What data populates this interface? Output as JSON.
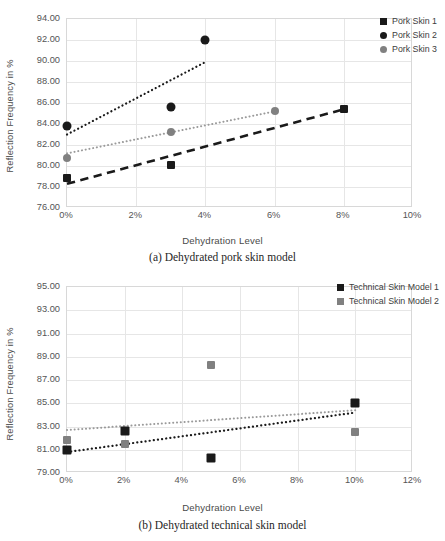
{
  "colors": {
    "series_black": "#1a1a1a",
    "series_gray": "#808080",
    "grid": "#e6e6e6",
    "axis_border": "#d8d8d8",
    "text": "#555555",
    "caption": "#262626"
  },
  "chart_data": [
    {
      "id": "a",
      "type": "scatter",
      "title": "",
      "caption": "(a) Dehydrated pork skin model",
      "xlabel": "Dehydration Level",
      "ylabel": "Reflection Frequency in %",
      "grid": true,
      "legend_position": "top-right",
      "xlim": [
        0,
        10
      ],
      "ylim": [
        76,
        94
      ],
      "xticks": [
        0,
        2,
        4,
        6,
        8,
        10
      ],
      "xtick_labels": [
        "0%",
        "2%",
        "4%",
        "6%",
        "8%",
        "10%"
      ],
      "yticks": [
        76,
        78,
        80,
        82,
        84,
        86,
        88,
        90,
        92,
        94
      ],
      "ytick_labels": [
        "76.00",
        "78.00",
        "80.00",
        "82.00",
        "84.00",
        "86.00",
        "88.00",
        "90.00",
        "92.00",
        "94.00"
      ],
      "series": [
        {
          "name": "Pork Skin 1",
          "marker": "square",
          "color": "#1a1a1a",
          "marker_size": 8,
          "points": [
            {
              "x": 0,
              "y": 78.9
            },
            {
              "x": 3,
              "y": 80.1
            },
            {
              "x": 8,
              "y": 85.4
            }
          ],
          "trendline": {
            "style": "dashed",
            "color": "#1a1a1a",
            "width": 2.6,
            "x0": 0,
            "y0": 78.3,
            "x1": 8,
            "y1": 85.4
          }
        },
        {
          "name": "Pork Skin 2",
          "marker": "circle",
          "color": "#1a1a1a",
          "marker_size": 9,
          "points": [
            {
              "x": 0,
              "y": 83.8
            },
            {
              "x": 3,
              "y": 85.6
            },
            {
              "x": 4,
              "y": 92.0
            }
          ],
          "trendline": {
            "style": "dotted",
            "color": "#1a1a1a",
            "width": 2.2,
            "x0": 0,
            "y0": 83.0,
            "x1": 4,
            "y1": 89.9
          }
        },
        {
          "name": "Pork Skin 3",
          "marker": "circle",
          "color": "#808080",
          "marker_size": 8,
          "points": [
            {
              "x": 0,
              "y": 80.8
            },
            {
              "x": 3,
              "y": 83.2
            },
            {
              "x": 6,
              "y": 85.2
            }
          ],
          "trendline": {
            "style": "dotted",
            "color": "#9a9a9a",
            "width": 2.0,
            "x0": 0,
            "y0": 81.2,
            "x1": 6,
            "y1": 85.2
          }
        }
      ]
    },
    {
      "id": "b",
      "type": "scatter",
      "title": "",
      "caption": "(b) Dehydrated technical skin model",
      "xlabel": "Dehydration Level",
      "ylabel": "Reflection Frequency in %",
      "grid": true,
      "legend_position": "top-right",
      "xlim": [
        0,
        12
      ],
      "ylim": [
        79,
        95
      ],
      "xticks": [
        0,
        2,
        4,
        6,
        8,
        10,
        12
      ],
      "xtick_labels": [
        "0%",
        "2%",
        "4%",
        "6%",
        "8%",
        "10%",
        "12%"
      ],
      "yticks": [
        79,
        81,
        83,
        85,
        87,
        89,
        91,
        93,
        95
      ],
      "ytick_labels": [
        "79.00",
        "81.00",
        "83.00",
        "85.00",
        "87.00",
        "89.00",
        "91.00",
        "93.00",
        "95.00"
      ],
      "series": [
        {
          "name": "Technical Skin Model 1",
          "marker": "square",
          "color": "#1a1a1a",
          "marker_size": 9,
          "points": [
            {
              "x": 0,
              "y": 81.0
            },
            {
              "x": 2,
              "y": 82.6
            },
            {
              "x": 5,
              "y": 80.3
            },
            {
              "x": 10,
              "y": 85.0
            }
          ],
          "trendline": {
            "style": "dotted",
            "color": "#1a1a1a",
            "width": 2.2,
            "x0": 0,
            "y0": 80.8,
            "x1": 10,
            "y1": 84.2
          }
        },
        {
          "name": "Technical Skin Model 2",
          "marker": "square",
          "color": "#808080",
          "marker_size": 8,
          "points": [
            {
              "x": 0,
              "y": 81.8
            },
            {
              "x": 2,
              "y": 81.5
            },
            {
              "x": 5,
              "y": 88.3
            },
            {
              "x": 10,
              "y": 82.5
            }
          ],
          "trendline": {
            "style": "dotted",
            "color": "#9a9a9a",
            "width": 2.0,
            "x0": 0,
            "y0": 82.7,
            "x1": 10,
            "y1": 84.4
          }
        }
      ]
    }
  ]
}
